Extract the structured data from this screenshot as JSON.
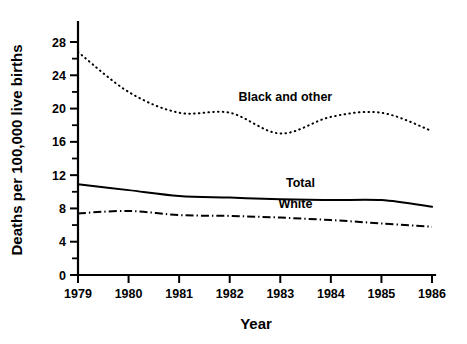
{
  "chart_data": {
    "type": "line",
    "title": "",
    "xlabel": "Year",
    "ylabel": "Deaths per 100,000 live births",
    "x": [
      1979,
      1980,
      1981,
      1982,
      1983,
      1984,
      1985,
      1986
    ],
    "categories": [
      "1979",
      "1980",
      "1981",
      "1982",
      "1983",
      "1984",
      "1985",
      "1986"
    ],
    "xlim": [
      1979,
      1986
    ],
    "ylim": [
      0,
      29.5
    ],
    "grid": false,
    "legend_position": "inline-annotations",
    "y_ticks_major": [
      0,
      4,
      8,
      12,
      16,
      20,
      24,
      28
    ],
    "y_ticks_minor": [
      2,
      6,
      10,
      14,
      18,
      22,
      26
    ],
    "y_tick_labels": [
      "0",
      "4",
      "8",
      "12",
      "16",
      "20",
      "24",
      "28"
    ],
    "x_tick_labels": [
      "1979",
      "1980",
      "1981",
      "1982",
      "1983",
      "1984",
      "1985",
      "1986"
    ],
    "series": [
      {
        "name": "Black and other",
        "style": "dotted",
        "color": "#000000",
        "values": [
          26.8,
          22.0,
          19.5,
          19.5,
          17.0,
          19.0,
          19.5,
          17.3
        ],
        "label_x": 1983.1,
        "label_y": 20.9
      },
      {
        "name": "Total",
        "style": "solid",
        "color": "#000000",
        "values": [
          10.9,
          10.2,
          9.5,
          9.3,
          9.1,
          9.0,
          9.0,
          8.2
        ],
        "label_x": 1983.4,
        "label_y": 10.6
      },
      {
        "name": "White",
        "style": "dash-dot",
        "color": "#000000",
        "values": [
          7.4,
          7.7,
          7.2,
          7.1,
          6.9,
          6.6,
          6.2,
          5.8
        ],
        "label_x": 1983.3,
        "label_y": 8.1
      }
    ]
  },
  "axis": {
    "y_title": "Deaths per 100,000 live births",
    "x_title": "Year"
  }
}
